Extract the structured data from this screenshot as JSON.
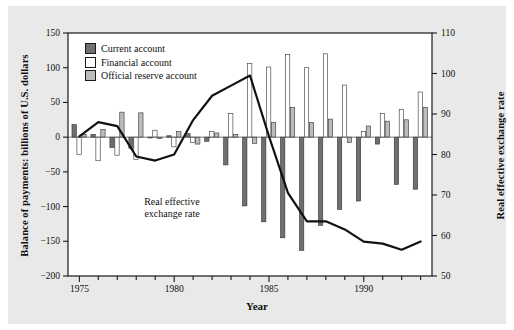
{
  "figure": {
    "background_color": "#e9e9e9",
    "plot_background_color": "#ffffff",
    "frame_color": "#1a1a1a"
  },
  "chart_data": {
    "type": "bar",
    "title": "",
    "subtitle": "",
    "xlabel": "Year",
    "ylabel": "Balance of payments: billions of U.S. dollars",
    "ylabel_right": "Real effective exchange rate",
    "xlim": [
      1974.4,
      1993.6
    ],
    "ylim": [
      -200,
      150
    ],
    "ylim_right": [
      50,
      110
    ],
    "grid": false,
    "legend_position": "upper-left-inside",
    "xticks": [
      1975,
      1976,
      1977,
      1978,
      1979,
      1980,
      1981,
      1982,
      1983,
      1984,
      1985,
      1986,
      1987,
      1988,
      1989,
      1990,
      1991,
      1992,
      1993
    ],
    "xticklabels": [
      "1975",
      "",
      "",
      "",
      "",
      "1980",
      "",
      "",
      "",
      "",
      "1985",
      "",
      "",
      "",
      "",
      "1990",
      "",
      "",
      ""
    ],
    "yticks": [
      -200,
      -150,
      -100,
      -50,
      0,
      50,
      100,
      150
    ],
    "yticklabels": [
      "−200",
      "−150",
      "−100",
      "−50",
      "0",
      "50",
      "100",
      "150"
    ],
    "yticks_right": [
      50,
      60,
      70,
      80,
      90,
      100,
      110
    ],
    "yticklabels_right": [
      "50",
      "60",
      "70",
      "80",
      "90",
      "100",
      "110"
    ],
    "categories": [
      1975,
      1976,
      1977,
      1978,
      1979,
      1980,
      1981,
      1982,
      1983,
      1984,
      1985,
      1986,
      1987,
      1988,
      1989,
      1990,
      1991,
      1992,
      1993
    ],
    "series": [
      {
        "name": "Current account",
        "color": "#6f6f6f",
        "edge": "#333333",
        "values": [
          18,
          4,
          -15,
          -16,
          -1,
          2,
          5,
          -6,
          -40,
          -99,
          -122,
          -145,
          -163,
          -127,
          -104,
          -92,
          -10,
          -68,
          -75
        ]
      },
      {
        "name": "Financial account",
        "color": "#ffffff",
        "edge": "#333333",
        "values": [
          -25,
          -34,
          -26,
          -32,
          10,
          -14,
          -8,
          8,
          34,
          106,
          101,
          119,
          100,
          120,
          75,
          8,
          34,
          40,
          65
        ]
      },
      {
        "name": "Official reserve account",
        "color": "#bcbcbc",
        "edge": "#333333",
        "values": [
          4,
          11,
          36,
          35,
          -2,
          8,
          -10,
          6,
          4,
          -9,
          21,
          43,
          21,
          26,
          -8,
          16,
          23,
          25,
          43
        ]
      }
    ],
    "line_series": {
      "name": "Real effective exchange rate",
      "color": "#111111",
      "axis": "right",
      "x": [
        1975,
        1976,
        1977,
        1978,
        1979,
        1980,
        1981,
        1982,
        1983,
        1984,
        1985,
        1986,
        1987,
        1988,
        1989,
        1990,
        1991,
        1992,
        1993
      ],
      "values": [
        84.5,
        88.0,
        87.0,
        79.5,
        78.5,
        80.0,
        88.5,
        94.5,
        97.0,
        99.5,
        84.5,
        70.5,
        63.5,
        63.5,
        61.5,
        58.5,
        58.0,
        56.5,
        58.5
      ],
      "annotation": "Real effective\nexchange rate"
    }
  },
  "legend": {
    "items": [
      {
        "label": "Current account",
        "swatch": "sw-current"
      },
      {
        "label": "Financial account",
        "swatch": "sw-financial"
      },
      {
        "label": "Official reserve account",
        "swatch": "sw-reserve"
      }
    ]
  },
  "annotation": {
    "line1": "Real effective",
    "line2": "exchange rate"
  },
  "axis_titles": {
    "left": "Balance of payments: billions of U.S. dollars",
    "right": "Real effective exchange rate",
    "bottom": "Year"
  }
}
